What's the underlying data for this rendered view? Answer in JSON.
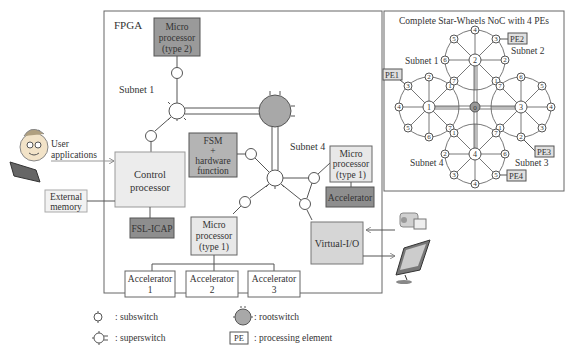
{
  "fpga": {
    "title": "FPGA",
    "subnet1": "Subnet 1",
    "subnet4": "Subnet 4",
    "micro_type2": [
      "Micro",
      "processor",
      "(type 2)"
    ],
    "fsm": [
      "FSM",
      "+",
      "hardware",
      "function"
    ],
    "control": [
      "Control",
      "processor"
    ],
    "fsl_icap": "FSL-ICAP",
    "micro_type1_a": [
      "Micro",
      "processor",
      "(type 1)"
    ],
    "micro_type1_b": [
      "Micro",
      "processor",
      "(type 1)"
    ],
    "accelerator": "Accelerator",
    "virtual_io": "Virtual-I/O",
    "accelerators": [
      {
        "label": "Accelerator",
        "num": "1"
      },
      {
        "label": "Accelerator",
        "num": "2"
      },
      {
        "label": "Accelerator",
        "num": "3"
      }
    ]
  },
  "external": {
    "user_apps": [
      "User",
      "applications"
    ],
    "memory": [
      "External",
      "memory"
    ]
  },
  "noc": {
    "title": "Complete Star-Wheels NoC with 4 PEs",
    "subnets": [
      "Subnet 1",
      "Subnet 2",
      "Subnet 3",
      "Subnet 4"
    ],
    "pes": [
      "PE1",
      "PE2",
      "PE3",
      "PE4"
    ],
    "root": "0",
    "hubs": [
      "1",
      "2",
      "3",
      "4"
    ]
  },
  "legend": {
    "subswitch": ": subswitch",
    "superswitch": ": superswitch",
    "rootswitch": ": rootswitch",
    "pe_box": "PE",
    "pe": ": processing element"
  },
  "colors": {
    "dark_box": "#9a9a9a",
    "mid_box": "#c4c4c4",
    "light_box": "#e8e8e8",
    "root": "#a8a8a8",
    "stroke": "#555555"
  }
}
